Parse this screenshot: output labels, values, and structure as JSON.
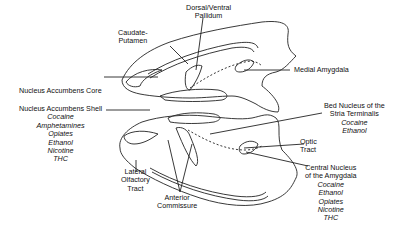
{
  "labels": {
    "dorsal_ventral_pallidum": {
      "line1": "Dorsal/Ventral",
      "line2": "Pallidum"
    },
    "caudate_putamen": {
      "line1": "Caudate-",
      "line2": "Putamen"
    },
    "nucleus_accumbens_core": {
      "name": "Nucleus Accumbens Core"
    },
    "nucleus_accumbens_shell": {
      "name": "Nucleus Accumbens Shell",
      "drugs": [
        "Cocaine",
        "Amphetamines",
        "Opiates",
        "Ethanol",
        "Nicotine",
        "THC"
      ]
    },
    "medial_amygdala": {
      "name": "Medial Amygdala"
    },
    "bed_nucleus": {
      "line1": "Bed Nucleus of the",
      "line2": "Stria Terminalis",
      "drugs": [
        "Cocaine",
        "Ethanol"
      ]
    },
    "optic_tract": {
      "line1": "Optic",
      "line2": "Tract"
    },
    "central_nucleus": {
      "line1": "Central Nucleus",
      "line2": "of the Amygdala",
      "drugs": [
        "Cocaine",
        "Ethanol",
        "Opiates",
        "Nicotine",
        "THC"
      ]
    },
    "lateral_olfactory_tract": {
      "line1": "Lateral",
      "line2": "Olfactory",
      "line3": "Tract"
    },
    "anterior_commissure": {
      "line1": "Anterior",
      "line2": "Commissure"
    }
  }
}
